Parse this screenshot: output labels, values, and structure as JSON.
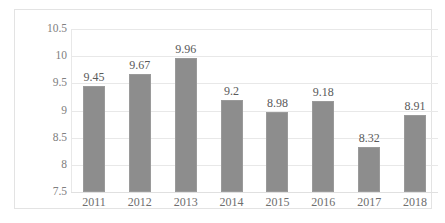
{
  "chart_data": {
    "type": "bar",
    "title": "",
    "subtitle": "",
    "xlabel": "",
    "ylabel": "",
    "categories": [
      "2011",
      "2012",
      "2013",
      "2014",
      "2015",
      "2016",
      "2017",
      "2018"
    ],
    "values": [
      9.45,
      9.67,
      9.96,
      9.2,
      8.98,
      9.18,
      8.32,
      8.91
    ],
    "data_labels": [
      "9.45",
      "9.67",
      "9.96",
      "9.2",
      "8.98",
      "9.18",
      "8.32",
      "8.91"
    ],
    "ylim": [
      7.5,
      10.5
    ],
    "yticks": [
      7.5,
      8,
      8.5,
      9,
      9.5,
      10,
      10.5
    ],
    "ytick_labels": [
      "7.5",
      "8",
      "8.5",
      "9",
      "9.5",
      "10",
      "10.5"
    ],
    "grid": true,
    "legend": null,
    "legend_position": "none",
    "series": [
      {
        "name": "",
        "values": [
          9.45,
          9.67,
          9.96,
          9.2,
          8.98,
          9.18,
          8.32,
          8.91
        ],
        "color": "#8d8d8d"
      }
    ],
    "colors": {
      "bar": "#8d8d8d",
      "bar_border": "#9a9a9a",
      "gridline": "#e8e8e8",
      "frame_border": "#e3e3e3",
      "tick_text": "#808080",
      "label_text": "#5a5a5a",
      "background": "#ffffff"
    }
  }
}
